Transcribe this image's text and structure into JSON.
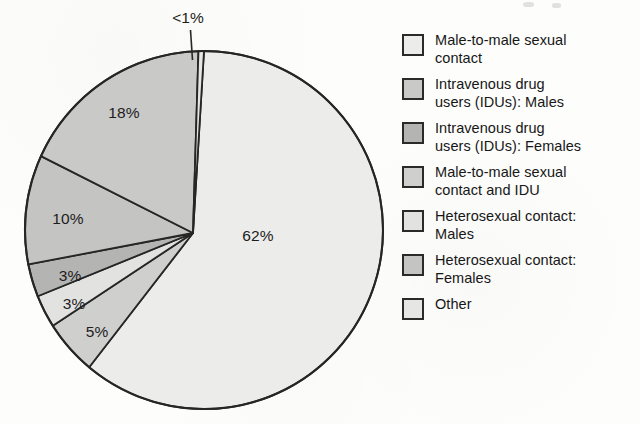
{
  "chart_data": {
    "type": "pie",
    "title": "",
    "categories": [
      "Male-to-male sexual contact",
      "Intravenous drug users (IDUs): Males",
      "Intravenous drug users (IDUs): Females",
      "Male-to-male sexual contact and IDU",
      "Heterosexual contact: Males",
      "Heterosexual contact: Females",
      "Other"
    ],
    "values": [
      62,
      18,
      3,
      5,
      3,
      10,
      0.5
    ],
    "value_labels": [
      "62%",
      "18%",
      "3%",
      "5%",
      "3%",
      "10%",
      "<1%"
    ],
    "legend_position": "right",
    "grid": false,
    "colors": [
      "#ececea",
      "#c9c9c7",
      "#b4b4b2",
      "#cfcfcd",
      "#e2e2e0",
      "#c4c4c2",
      "#e6e6e4"
    ],
    "stroke_color": "#262626"
  },
  "pie": {
    "labels": [
      {
        "text": "62%",
        "x": 258,
        "y": 236
      },
      {
        "text": "18%",
        "x": 124,
        "y": 113
      },
      {
        "text": "10%",
        "x": 68,
        "y": 219
      },
      {
        "text": "3%",
        "x": 70,
        "y": 276
      },
      {
        "text": "3%",
        "x": 74,
        "y": 304
      },
      {
        "text": "5%",
        "x": 97,
        "y": 332
      }
    ],
    "callout": {
      "text": "<1%",
      "x": 188,
      "y": 18
    }
  },
  "legend": {
    "items": [
      {
        "label": "Male-to-male sexual\ncontact",
        "swatch_color": "#ececea"
      },
      {
        "label": "Intravenous drug\nusers (IDUs): Males",
        "swatch_color": "#c9c9c7"
      },
      {
        "label": "Intravenous drug\nusers (IDUs): Females",
        "swatch_color": "#b4b4b2"
      },
      {
        "label": "Male-to-male sexual\ncontact and IDU",
        "swatch_color": "#cfcfcd"
      },
      {
        "label": "Heterosexual contact:\nMales",
        "swatch_color": "#e2e2e0"
      },
      {
        "label": "Heterosexual contact:\nFemales",
        "swatch_color": "#c4c4c2"
      },
      {
        "label": "Other",
        "swatch_color": "#e6e6e4"
      }
    ]
  }
}
